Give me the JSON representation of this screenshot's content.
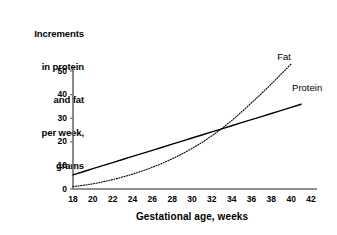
{
  "chart_data": {
    "type": "line",
    "title": "",
    "xlabel": "Gestational age, weeks",
    "ylabel": "Increments in protein and fat per week, grams",
    "ylabel_lines": [
      "Increments",
      "in protein",
      "and fat",
      "per week,",
      "grams"
    ],
    "xlim": [
      18,
      42
    ],
    "ylim": [
      0,
      50
    ],
    "xticks": [
      18,
      20,
      22,
      24,
      26,
      28,
      30,
      32,
      34,
      36,
      38,
      40,
      42
    ],
    "yticks": [
      0,
      10,
      20,
      30,
      40,
      50
    ],
    "grid": false,
    "legend_position": "inline-annotation",
    "annotations": [
      {
        "text": "Fat",
        "x": 39.5,
        "y": 56
      },
      {
        "text": "Protein",
        "x": 41.0,
        "y": 43
      }
    ],
    "series": [
      {
        "name": "Protein",
        "style": "solid",
        "color": "#000000",
        "x": [
          18,
          20,
          22,
          24,
          26,
          28,
          30,
          32,
          34,
          36,
          38,
          40,
          41
        ],
        "values": [
          6.0,
          8.6,
          11.2,
          13.8,
          16.4,
          19.0,
          21.6,
          24.2,
          26.8,
          29.4,
          32.0,
          34.6,
          35.9
        ]
      },
      {
        "name": "Fat",
        "style": "dotted",
        "color": "#000000",
        "x": [
          18,
          20,
          22,
          24,
          26,
          28,
          30,
          32,
          34,
          36,
          38,
          40
        ],
        "values": [
          1.0,
          2.2,
          4.0,
          6.3,
          9.2,
          12.8,
          17.2,
          22.5,
          29.0,
          36.5,
          44.5,
          53.0
        ]
      }
    ],
    "crossover": {
      "x": 33.7,
      "y": 27.0
    }
  }
}
